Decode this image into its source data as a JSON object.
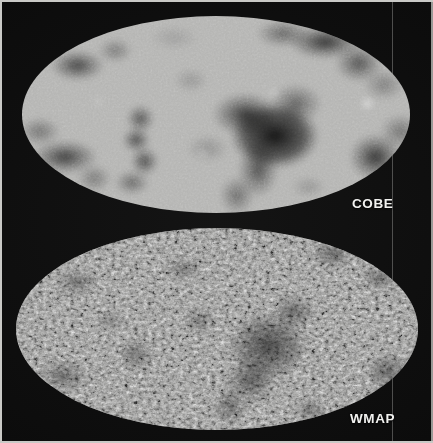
{
  "figure": {
    "width": 433,
    "height": 443,
    "background_color": "#0a0a0a",
    "page_edge_color": "#c9c9c6"
  },
  "maps": [
    {
      "id": "cobe",
      "label": "COBE",
      "label_color": "#f2f2f0",
      "projection": "mollweide-ellipse",
      "resolution": "coarse",
      "base_color": "#b4b4b2",
      "cold_spot_color": "#1c1c1c",
      "hot_spot_color": "#ffffff",
      "bounds": {
        "x": 22,
        "y": 16,
        "width": 388,
        "height": 197
      }
    },
    {
      "id": "wmap",
      "label": "WMAP",
      "label_color": "#f2f2f0",
      "projection": "mollweide-ellipse",
      "resolution": "fine",
      "base_color": "#a8a8a6",
      "cold_spot_color": "#121212",
      "hot_spot_color": "#ffffff",
      "bounds": {
        "x": 16,
        "y": 228,
        "width": 402,
        "height": 202
      }
    }
  ]
}
